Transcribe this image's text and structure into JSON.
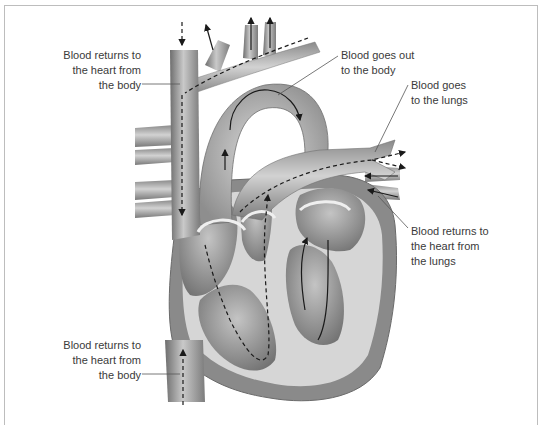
{
  "diagram": {
    "type": "heart-blood-flow",
    "labels": [
      {
        "id": "vena-cava-superior",
        "lines": [
          "Blood returns to",
          "the heart from",
          "the body"
        ]
      },
      {
        "id": "aorta",
        "lines": [
          "Blood goes out",
          "to the body"
        ]
      },
      {
        "id": "pulmonary-artery",
        "lines": [
          "Blood goes",
          "to the lungs"
        ]
      },
      {
        "id": "pulmonary-veins",
        "lines": [
          "Blood returns to",
          "the heart from",
          "the lungs"
        ]
      },
      {
        "id": "vena-cava-inferior",
        "lines": [
          "Blood returns to",
          "the heart from",
          "the body"
        ]
      }
    ],
    "colors": {
      "frame": "#bdbdbd",
      "label_text": "#3a3a3a",
      "tissue_dark": "#7a7a7a",
      "tissue_mid": "#a8a8a8",
      "tissue_light": "#d9d9d9",
      "arrow": "#1a1a1a"
    }
  }
}
